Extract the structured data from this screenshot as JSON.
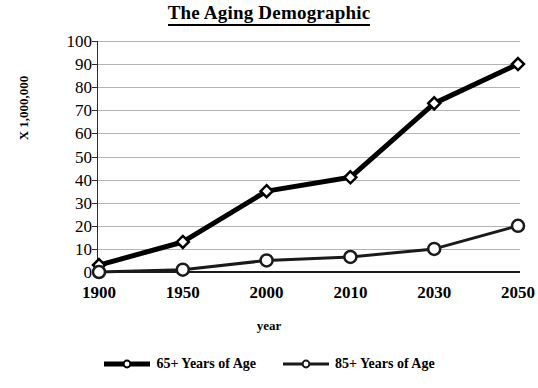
{
  "chart_data": {
    "type": "line",
    "title": "The Aging Demographic",
    "xlabel": "year",
    "ylabel": "X 1,000,000",
    "categories": [
      "1900",
      "1950",
      "2000",
      "2010",
      "2030",
      "2050"
    ],
    "ylim": [
      0,
      100
    ],
    "yticks": [
      0,
      10,
      20,
      30,
      40,
      50,
      60,
      70,
      80,
      90,
      100
    ],
    "grid": true,
    "legend_position": "bottom",
    "series": [
      {
        "name": "65+ Years of Age",
        "values": [
          3,
          13,
          35,
          41,
          73,
          90
        ],
        "marker": "diamond",
        "color": "#000000",
        "line_width": 5
      },
      {
        "name": "85+ Years of Age",
        "values": [
          0,
          1,
          5,
          6.5,
          10,
          20
        ],
        "marker": "circle",
        "color": "#1a1a1a",
        "line_width": 3
      }
    ]
  },
  "colors": {
    "gridline": "#b4b4b4",
    "axis": "#2b2b2b",
    "text": "#000000",
    "background": "#ffffff"
  }
}
